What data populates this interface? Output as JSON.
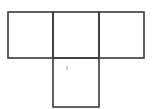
{
  "diagram": {
    "type": "square-grid",
    "line_color": "#3a3a3a",
    "line_width": 1.6,
    "squares": [
      {
        "name": "top-left-square",
        "x": 8,
        "y": 12,
        "w": 45,
        "h": 46
      },
      {
        "name": "top-middle-square",
        "x": 53,
        "y": 12,
        "w": 46,
        "h": 46
      },
      {
        "name": "top-right-square",
        "x": 99,
        "y": 12,
        "w": 45,
        "h": 46
      },
      {
        "name": "bottom-middle-square",
        "x": 53,
        "y": 58,
        "w": 46,
        "h": 49
      }
    ],
    "marks": [
      {
        "name": "small-dot-mark",
        "x": 67,
        "y": 68,
        "color": "#9a9a9a"
      }
    ]
  }
}
